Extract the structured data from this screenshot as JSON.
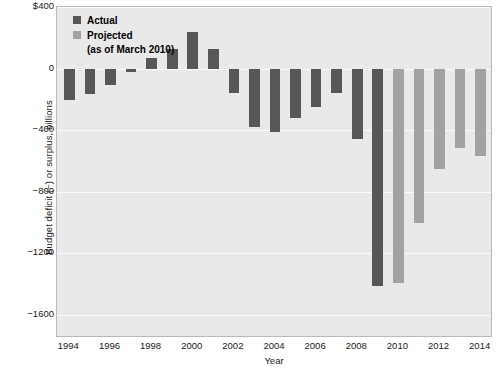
{
  "chart_data": {
    "type": "bar",
    "title": "",
    "xlabel": "Year",
    "ylabel": "Budget deficit (−) or surplus, billions",
    "ylim": [
      -1750,
      400
    ],
    "xlim": [
      1993.4,
      2014.6
    ],
    "grid": true,
    "y_ticks": [
      400,
      0,
      -400,
      -800,
      -1200,
      -1600
    ],
    "y_tick_labels": [
      "$400",
      "0",
      "−400",
      "−800",
      "−1200",
      "−1600"
    ],
    "x_ticks": [
      1994,
      1996,
      1998,
      2000,
      2002,
      2004,
      2006,
      2008,
      2010,
      2012,
      2014
    ],
    "x_tick_labels": [
      "1994",
      "1996",
      "1998",
      "2000",
      "2002",
      "2004",
      "2006",
      "2008",
      "2010",
      "2012",
      "2014"
    ],
    "legend": {
      "position": "top-left",
      "entries": [
        {
          "name": "Actual",
          "color": "#575757"
        },
        {
          "name": "Projected",
          "color": "#a2a2a2"
        }
      ],
      "note": "(as of March 2010)"
    },
    "categories": [
      1994,
      1995,
      1996,
      1997,
      1998,
      1999,
      2000,
      2001,
      2002,
      2003,
      2004,
      2005,
      2006,
      2007,
      2008,
      2009,
      2010,
      2011,
      2012,
      2013,
      2014
    ],
    "series": [
      {
        "name": "Actual",
        "color": "#575757",
        "values": [
          -203,
          -164,
          -107,
          -22,
          69,
          126,
          236,
          128,
          -158,
          -378,
          -413,
          -318,
          -248,
          -161,
          -459,
          -1413,
          null,
          null,
          null,
          null,
          null
        ]
      },
      {
        "name": "Projected",
        "color": "#a2a2a2",
        "values": [
          null,
          null,
          null,
          null,
          null,
          null,
          null,
          null,
          null,
          null,
          null,
          null,
          null,
          null,
          null,
          null,
          -1391,
          -1000,
          -650,
          -518,
          -566
        ]
      }
    ]
  },
  "axes": {
    "plot_background": "#e9e9e9",
    "gridline_color": "#fbfbfb",
    "border_color": "#b9b9b9"
  }
}
